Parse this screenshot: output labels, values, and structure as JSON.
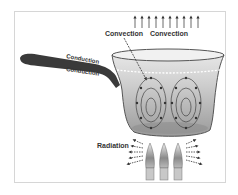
{
  "diagram": {
    "labels": {
      "convection_left": "Convection",
      "convection_right": "Convection",
      "conduction_top": "Conduction",
      "conduction_bottom": "Conduction",
      "radiation": "Radiation"
    },
    "components": [
      "saucepan",
      "handle",
      "water",
      "convection-currents",
      "burner-flames",
      "rising-heat-arrows",
      "radiation-arrows"
    ],
    "colors": {
      "frame": "#d6d6d6",
      "handle": "#3a3a3a",
      "pot_outline": "#555555",
      "water": "#bdbdbd",
      "text": "#333333"
    }
  }
}
